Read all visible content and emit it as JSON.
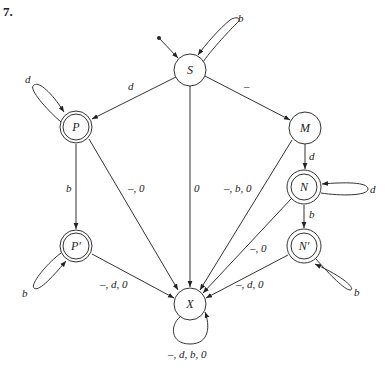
{
  "problem_number": "7.",
  "states": [
    {
      "id": "S",
      "label": "S",
      "accepting": false,
      "start": true,
      "cx": 190,
      "cy": 70
    },
    {
      "id": "P",
      "label": "P",
      "accepting": true,
      "start": false,
      "cx": 76,
      "cy": 127
    },
    {
      "id": "M",
      "label": "M",
      "accepting": false,
      "start": false,
      "cx": 305,
      "cy": 128
    },
    {
      "id": "N",
      "label": "N",
      "accepting": true,
      "start": false,
      "cx": 304,
      "cy": 187
    },
    {
      "id": "Pp",
      "label": "P′",
      "accepting": true,
      "start": false,
      "cx": 76,
      "cy": 246
    },
    {
      "id": "Np",
      "label": "N′",
      "accepting": true,
      "start": false,
      "cx": 304,
      "cy": 246
    },
    {
      "id": "X",
      "label": "X",
      "accepting": false,
      "start": false,
      "cx": 190,
      "cy": 304
    }
  ],
  "transitions": [
    {
      "from": "S",
      "to": "S",
      "label": "b"
    },
    {
      "from": "S",
      "to": "P",
      "label": "d"
    },
    {
      "from": "S",
      "to": "M",
      "label": "–"
    },
    {
      "from": "S",
      "to": "X",
      "label": "0"
    },
    {
      "from": "P",
      "to": "P",
      "label": "d"
    },
    {
      "from": "P",
      "to": "Pp",
      "label": "b"
    },
    {
      "from": "P",
      "to": "X",
      "label": "–, 0"
    },
    {
      "from": "M",
      "to": "N",
      "label": "d"
    },
    {
      "from": "M",
      "to": "X",
      "label": "–, b, 0"
    },
    {
      "from": "N",
      "to": "N",
      "label": "d"
    },
    {
      "from": "N",
      "to": "Np",
      "label": "b"
    },
    {
      "from": "N",
      "to": "X",
      "label": "–, 0"
    },
    {
      "from": "Pp",
      "to": "Pp",
      "label": "b"
    },
    {
      "from": "Pp",
      "to": "X",
      "label": "–, d, 0"
    },
    {
      "from": "Np",
      "to": "Np",
      "label": "b"
    },
    {
      "from": "Np",
      "to": "X",
      "label": "–, d, 0"
    },
    {
      "from": "X",
      "to": "X",
      "label": "–, d, b, 0"
    }
  ],
  "labels": {
    "S": "S",
    "P": "P",
    "M": "M",
    "N": "N",
    "Pp": "P′",
    "Np": "N′",
    "X": "X",
    "S_S": "b",
    "S_P": "d",
    "S_M": "–",
    "S_X": "0",
    "P_P": "d",
    "P_Pp": "b",
    "P_X": "–, 0",
    "M_N": "d",
    "M_X": "–, b, 0",
    "N_N": "d",
    "N_Np": "b",
    "N_X": "–, 0",
    "Pp_Pp": "b",
    "Pp_X": "–, d, 0",
    "Np_Np": "b",
    "Np_X": "–, d, 0",
    "X_X": "–, d, b, 0"
  }
}
